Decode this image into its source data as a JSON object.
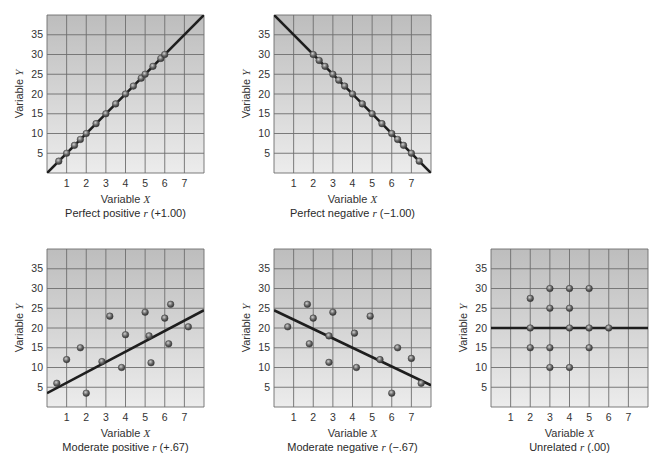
{
  "figure": {
    "x_axis_label": "Variable",
    "x_axis_var": "X",
    "y_axis_label": "Variable",
    "y_axis_var": "Y",
    "x_ticks": [
      1,
      2,
      3,
      4,
      5,
      6,
      7
    ],
    "y_ticks": [
      5,
      10,
      15,
      20,
      25,
      30,
      35
    ]
  },
  "panels": [
    {
      "id": "perfect-positive",
      "caption_prefix": "Perfect positive",
      "caption_r": "r",
      "caption_value": "(+1.00)"
    },
    {
      "id": "perfect-negative",
      "caption_prefix": "Perfect negative",
      "caption_r": "r",
      "caption_value": "(−1.00)"
    },
    {
      "id": "moderate-positive",
      "caption_prefix": "Moderate positive",
      "caption_r": "r",
      "caption_value": "(+.67)"
    },
    {
      "id": "moderate-negative",
      "caption_prefix": "Moderate negative",
      "caption_r": "r",
      "caption_value": "(−.67)"
    },
    {
      "id": "unrelated",
      "caption_prefix": "Unrelated",
      "caption_r": "r",
      "caption_value": "(.00)"
    }
  ],
  "chart_data": [
    {
      "type": "scatter",
      "title": "Perfect positive r (+1.00)",
      "xlabel": "Variable X",
      "ylabel": "Variable Y",
      "xlim": [
        0,
        8
      ],
      "ylim": [
        0,
        40
      ],
      "grid": true,
      "reported_r": 1.0,
      "points_are_estimates": true,
      "points": [
        [
          0.6,
          3
        ],
        [
          1,
          5
        ],
        [
          1.4,
          7
        ],
        [
          1.7,
          8.5
        ],
        [
          2,
          10
        ],
        [
          2.5,
          12.5
        ],
        [
          3,
          15
        ],
        [
          3.5,
          17.5
        ],
        [
          4,
          20
        ],
        [
          4.4,
          22
        ],
        [
          4.8,
          24
        ],
        [
          5,
          25
        ],
        [
          5.4,
          27
        ],
        [
          5.8,
          29
        ],
        [
          6,
          30
        ]
      ],
      "fit_line_visual": [
        [
          0,
          0
        ],
        [
          8,
          40
        ]
      ]
    },
    {
      "type": "scatter",
      "title": "Perfect negative r (−1.00)",
      "xlabel": "Variable X",
      "ylabel": "Variable Y",
      "xlim": [
        0,
        8
      ],
      "ylim": [
        0,
        40
      ],
      "grid": true,
      "reported_r": -1.0,
      "points_are_estimates": true,
      "points": [
        [
          2,
          30
        ],
        [
          2.3,
          28.5
        ],
        [
          2.6,
          27
        ],
        [
          3,
          25
        ],
        [
          3.3,
          23.5
        ],
        [
          3.6,
          22
        ],
        [
          4,
          20
        ],
        [
          4.5,
          17.5
        ],
        [
          5,
          15
        ],
        [
          5.5,
          12.5
        ],
        [
          6,
          10
        ],
        [
          6.3,
          8.5
        ],
        [
          6.6,
          7
        ],
        [
          7,
          5
        ],
        [
          7.4,
          3
        ]
      ],
      "fit_line_visual": [
        [
          0,
          40
        ],
        [
          8,
          0
        ]
      ]
    },
    {
      "type": "scatter",
      "title": "Moderate positive r (+.67)",
      "xlabel": "Variable X",
      "ylabel": "Variable Y",
      "xlim": [
        0,
        8
      ],
      "ylim": [
        0,
        40
      ],
      "grid": true,
      "reported_r": 0.67,
      "points_are_estimates": true,
      "points": [
        [
          0.5,
          6
        ],
        [
          1,
          12
        ],
        [
          1.7,
          15
        ],
        [
          2,
          3.5
        ],
        [
          2.8,
          11.5
        ],
        [
          3.2,
          23
        ],
        [
          3.8,
          10
        ],
        [
          4,
          18.3
        ],
        [
          5,
          24
        ],
        [
          5.2,
          18
        ],
        [
          5.3,
          11.2
        ],
        [
          6,
          22.5
        ],
        [
          6.2,
          16
        ],
        [
          6.3,
          26
        ],
        [
          7.2,
          20.3
        ]
      ],
      "fit_line_visual": [
        [
          0,
          3.5
        ],
        [
          8,
          24.5
        ]
      ]
    },
    {
      "type": "scatter",
      "title": "Moderate negative r (−.67)",
      "xlabel": "Variable X",
      "ylabel": "Variable Y",
      "xlim": [
        0,
        8
      ],
      "ylim": [
        0,
        40
      ],
      "grid": true,
      "reported_r": -0.67,
      "points_are_estimates": true,
      "points": [
        [
          0.7,
          20.3
        ],
        [
          1.7,
          26
        ],
        [
          1.8,
          16
        ],
        [
          2,
          22.5
        ],
        [
          2.8,
          11.3
        ],
        [
          2.8,
          18
        ],
        [
          3,
          24
        ],
        [
          4.1,
          18.7
        ],
        [
          4.2,
          10
        ],
        [
          4.9,
          23
        ],
        [
          5.4,
          12
        ],
        [
          6,
          3.5
        ],
        [
          6.3,
          15
        ],
        [
          7,
          12.3
        ],
        [
          7.5,
          6
        ]
      ],
      "fit_line_visual": [
        [
          0,
          24.5
        ],
        [
          8,
          5.5
        ]
      ]
    },
    {
      "type": "scatter",
      "title": "Unrelated r (.00)",
      "xlabel": "Variable X",
      "ylabel": "Variable Y",
      "xlim": [
        0,
        8
      ],
      "ylim": [
        0,
        40
      ],
      "grid": true,
      "reported_r": 0.0,
      "points_are_estimates": true,
      "points": [
        [
          2,
          27.5
        ],
        [
          2,
          20
        ],
        [
          2,
          15
        ],
        [
          3,
          30
        ],
        [
          3,
          25
        ],
        [
          3,
          15
        ],
        [
          3,
          10
        ],
        [
          4,
          30
        ],
        [
          4,
          25
        ],
        [
          4,
          20
        ],
        [
          4,
          10
        ],
        [
          5,
          30
        ],
        [
          5,
          20
        ],
        [
          5,
          15
        ],
        [
          6,
          20
        ]
      ],
      "fit_line_visual": [
        [
          0,
          20
        ],
        [
          8,
          20
        ]
      ]
    }
  ]
}
